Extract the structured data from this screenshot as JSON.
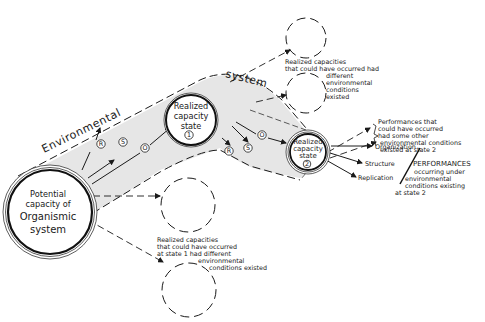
{
  "potential": {
    "lines": [
      "Potential",
      "capacity of",
      "Organismic",
      "system"
    ]
  },
  "state1": {
    "lines": [
      "Realized",
      "capacity",
      "state"
    ],
    "number": "1"
  },
  "state2": {
    "lines": [
      "Realized",
      "capacity",
      "state"
    ],
    "number": "2"
  },
  "band_labels": {
    "left": "Environmental",
    "right": "system"
  },
  "path_markers": [
    "R",
    "S",
    "O"
  ],
  "top_alt_note": {
    "lines": [
      "Realized capacities",
      "that could have occurred had",
      "different",
      "environmental",
      "conditions",
      "existed"
    ]
  },
  "bottom_alt_note": {
    "lines": [
      "Realized capacities",
      "that could have occurred",
      "at state 1 had different",
      "environmental",
      "conditions existed"
    ]
  },
  "alt_performances": {
    "lines": [
      "Performances that",
      "could have occurred",
      "had some other",
      "environmental conditions",
      "existed at state 2"
    ]
  },
  "outputs": [
    "Organization",
    "Structure",
    "Replication"
  ],
  "performances": {
    "title": "PERFORMANCES",
    "lines": [
      "occurring under",
      "environmental",
      "conditions existing",
      "at state 2"
    ]
  }
}
